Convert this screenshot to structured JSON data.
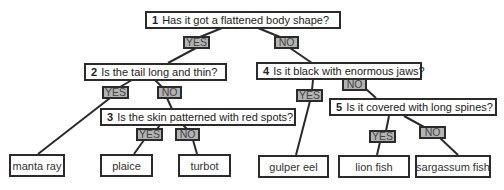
{
  "questions": [
    {
      "number": "1",
      "text": "Has it got a flattened body shape?"
    },
    {
      "number": "2",
      "text": "Is the tail long and thin?"
    },
    {
      "number": "3",
      "text": "Is the skin patterned with red spots?"
    },
    {
      "number": "4",
      "text": "Is it black with enormous jaws?"
    },
    {
      "number": "5",
      "text": "Is it covered with long spines?"
    }
  ],
  "answers": {
    "yes": "YES",
    "no": "NO"
  },
  "leaves": [
    "manta ray",
    "plaice",
    "turbot",
    "gulper eel",
    "lion fish",
    "sargassum fish"
  ]
}
